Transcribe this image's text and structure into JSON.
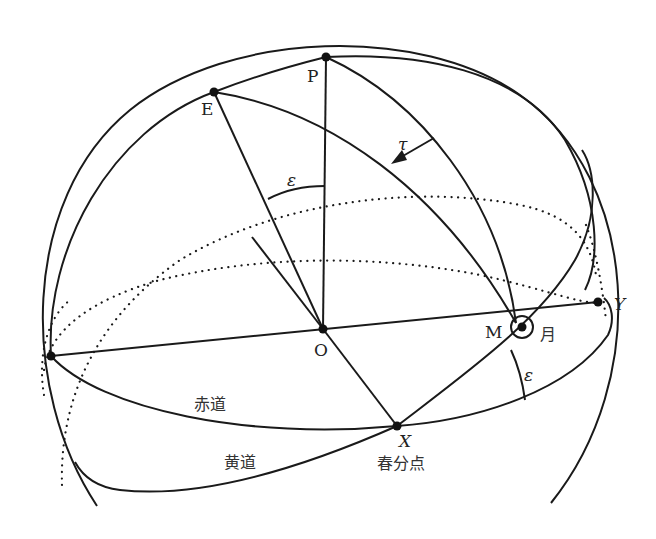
{
  "diagram": {
    "title": "",
    "type": "celestial-sphere",
    "colors": {
      "stroke": "#1a1a1a",
      "background": "#ffffff",
      "text": "#222222"
    },
    "points": {
      "P": {
        "label": "P",
        "x": 326,
        "y": 57
      },
      "E": {
        "label": "E",
        "x": 214,
        "y": 92
      },
      "O": {
        "label": "O",
        "x": 323,
        "y": 329
      },
      "X": {
        "label": "X",
        "x": 397,
        "y": 426
      },
      "Y": {
        "label": "Y",
        "x": 598,
        "y": 302
      },
      "M": {
        "label": "M",
        "x": 516,
        "y": 323
      },
      "W": {
        "label": "",
        "x": 51,
        "y": 356
      }
    },
    "labels": {
      "P": "P",
      "E": "E",
      "O": "O",
      "X": "X",
      "Y": "Y",
      "M": "M",
      "tau": "τ",
      "epsilon_top": "ε",
      "epsilon_bottom": "ε",
      "moon": "月",
      "equator": "赤道",
      "ecliptic": "黄道",
      "vernal_equinox": "春分点"
    },
    "legend": {
      "月": "Moon",
      "赤道": "Celestial equator",
      "黄道": "Ecliptic",
      "春分点": "Vernal equinox"
    }
  }
}
